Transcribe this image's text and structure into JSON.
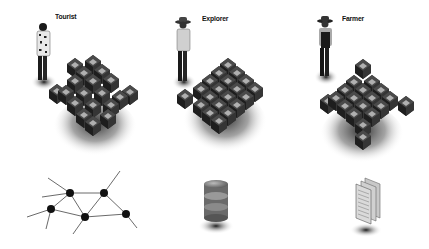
{
  "diagram": {
    "panels": [
      {
        "id": "tourist",
        "label": "Tourist",
        "figure": "person-hawaiian-shirt",
        "cube_grid": "irregular-cluster",
        "bottom_icon": "network-graph-icon"
      },
      {
        "id": "explorer",
        "label": "Explorer",
        "figure": "person-sun-hat",
        "cube_grid": "regular-4x4-with-detached-cube",
        "bottom_icon": "database-cylinder-icon"
      },
      {
        "id": "farmer",
        "label": "Farmer",
        "figure": "person-overalls-hat",
        "cube_grid": "diamond-with-outlier-cubes",
        "bottom_icon": "document-stack-icon"
      }
    ],
    "colors": {
      "background": "#ffffff",
      "cube_frame": "#3a3a3a",
      "cube_face": "#aaaaaa",
      "shadow": "#555555",
      "node": "#111111",
      "edge": "#444444"
    }
  }
}
